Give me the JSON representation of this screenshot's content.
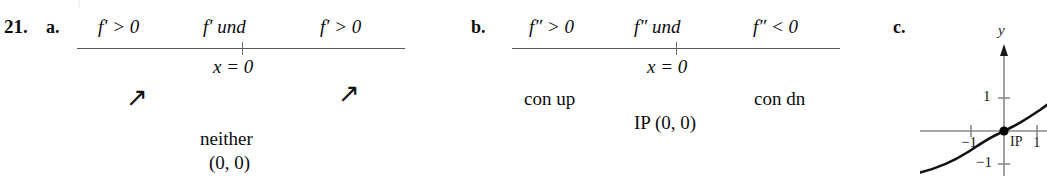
{
  "exercise": {
    "number": "21."
  },
  "parts": {
    "a": {
      "label": "a.",
      "sign_left": "f′ > 0",
      "sign_mid": "f′ und",
      "sign_right": "f′ > 0",
      "tick_label": "x = 0",
      "arrow_left": "↗",
      "arrow_right": "↗",
      "conclusion": "neither",
      "conclusion_point": "(0, 0)"
    },
    "b": {
      "label": "b.",
      "sign_left": "f″ > 0",
      "sign_mid": "f″ und",
      "sign_right": "f″ < 0",
      "tick_label": "x = 0",
      "concavity_left": "con up",
      "concavity_right": "con dn",
      "inflection": "IP (0, 0)"
    },
    "c": {
      "label": "c.",
      "graph": {
        "y_axis_label": "y",
        "y_tick_pos": "1",
        "y_tick_neg": "−1",
        "x_tick_neg": "−1",
        "x_tick_pos": "1",
        "point_label": "IP",
        "curve_description": "cube-root shaped increasing curve through origin with vertical tangent",
        "inflection_point": "(0, 0)"
      }
    }
  },
  "colors": {
    "ink": "#0d0d0d",
    "rule": "#55585c",
    "axis": "#808080",
    "curve": "#111111"
  }
}
